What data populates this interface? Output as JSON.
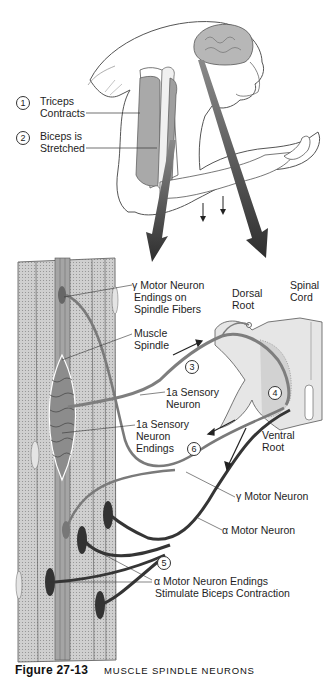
{
  "figure": {
    "caption_label": "Figure 27-13",
    "caption_title": "MUSCLE SPINDLE NEURONS",
    "caption_note": "Caption partially cut off at bottom edge of image"
  },
  "top_panel": {
    "subject": "monkey-arm-and-brain",
    "steps": [
      {
        "number": "1",
        "glyph": "①",
        "label_line1": "Triceps",
        "label_line2": "Contracts"
      },
      {
        "number": "2",
        "glyph": "②",
        "label_line1": "Biceps is",
        "label_line2": "Stretched"
      }
    ],
    "small_arrows": [
      "down-arrow",
      "down-arrow"
    ],
    "big_arrows": [
      "left-pointing-down-arrow",
      "right-pointing-down-arrow"
    ]
  },
  "bottom_panel": {
    "labels": {
      "gamma_endings": {
        "line1": "γ Motor Neuron",
        "line2": "Endings on",
        "line3": "Spindle Fibers"
      },
      "muscle_spindle": {
        "line1": "Muscle",
        "line2": "Spindle"
      },
      "dorsal_root": {
        "line1": "Dorsal",
        "line2": "Root"
      },
      "spinal_cord": {
        "line1": "Spinal",
        "line2": "Cord"
      },
      "sensory_neuron": {
        "line1": "1a Sensory",
        "line2": "Neuron"
      },
      "sensory_endings": {
        "line1": "1a Sensory",
        "line2": "Neuron",
        "line3": "Endings"
      },
      "ventral_root": {
        "line1": "Ventral",
        "line2": "Root"
      },
      "gamma_motor": "γ Motor Neuron",
      "alpha_motor": "α Motor Neuron",
      "alpha_endings": {
        "line1": "α Motor Neuron Endings",
        "line2": "Stimulate Biceps Contraction"
      }
    },
    "steps": [
      {
        "number": "3",
        "glyph": "③"
      },
      {
        "number": "4",
        "glyph": "④"
      },
      {
        "number": "5",
        "glyph": "⑤"
      },
      {
        "number": "6",
        "glyph": "⑥"
      }
    ]
  },
  "colors": {
    "muscle_fill": "#c8c8c8",
    "spindle_fill": "#9a9a9a",
    "neuron_sensory": "#8a8a8a",
    "neuron_alpha": "#3a3a3a",
    "big_arrow": "#3c3c3c",
    "outline": "#444444"
  }
}
